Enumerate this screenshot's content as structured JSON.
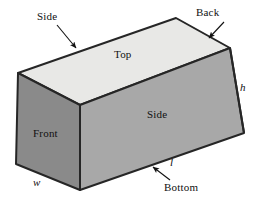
{
  "figure": {
    "kind": "rectangular-prism-diagram",
    "colors": {
      "background": "#ffffff",
      "top_face": "#e8e8e6",
      "left_face": "#8a8a8a",
      "right_face": "#a8a8a8",
      "edge_stroke": "#262626",
      "text": "#111111",
      "arrow": "#111111"
    },
    "faces": {
      "top_label": "Top",
      "front_label": "Front",
      "side_right_label": "Side",
      "side_top_label": "Side",
      "back_label": "Back",
      "bottom_label": "Bottom"
    },
    "dimensions": {
      "height_label": "h",
      "width_label": "w",
      "length_label": "l"
    },
    "vertices": {
      "left_top": [
        18,
        73
      ],
      "back_top": [
        176,
        18
      ],
      "right_top": [
        230,
        48
      ],
      "front_top": [
        80,
        105
      ],
      "left_bottom": [
        16,
        164
      ],
      "front_bottom": [
        80,
        190
      ],
      "right_bottom": [
        244,
        133
      ]
    },
    "annotations": [
      {
        "label": "Side",
        "points_to": "top-left-edge",
        "has_arrow": true
      },
      {
        "label": "Back",
        "points_to": "back-right-edge",
        "has_arrow": true
      },
      {
        "label": "Bottom",
        "points_to": "bottom-edge",
        "has_arrow": true
      }
    ]
  }
}
